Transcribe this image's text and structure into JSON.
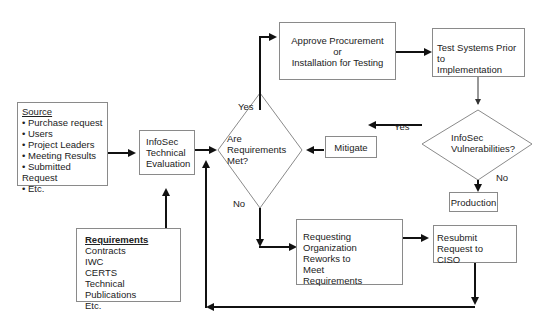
{
  "nodes": {
    "source": {
      "title": "Source",
      "items": [
        "Purchase request",
        "Users",
        "Project Leaders",
        "Meeting Results",
        "Submitted Request",
        "Etc."
      ]
    },
    "requirements": {
      "title": "Requirements",
      "items": [
        "Contracts",
        "IWC",
        "CERTS",
        "Technical Publications",
        "Etc."
      ]
    },
    "infosec_eval": {
      "lines": [
        "InfoSec",
        "Technical",
        "Evaluation"
      ]
    },
    "req_met": {
      "lines": [
        "Are",
        "Requirements",
        "Met?"
      ]
    },
    "approve": {
      "lines": [
        "Approve Procurement",
        "or",
        "Installation for Testing"
      ]
    },
    "test_systems": {
      "lines": [
        "Test Systems Prior to",
        "Implementation"
      ]
    },
    "vulnerabilities": {
      "lines": [
        "InfoSec",
        "Vulnerabilities?"
      ]
    },
    "mitigate": {
      "label": "Mitigate"
    },
    "production": {
      "label": "Production"
    },
    "rework": {
      "lines": [
        "Requesting Organization",
        "Reworks to",
        "Meet",
        "Requirements"
      ]
    },
    "resubmit": {
      "lines": [
        "Resubmit Request to",
        "CISO"
      ]
    }
  },
  "edge_labels": {
    "yes_top": "Yes",
    "no_bottom": "No",
    "yes_vuln": "Yes",
    "no_vuln": "No"
  },
  "colors": {
    "line": "#111111",
    "box_border": "#8a8a8a",
    "background": "#ffffff"
  }
}
